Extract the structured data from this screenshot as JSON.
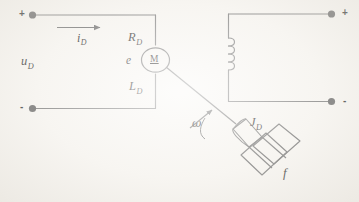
{
  "figure": {
    "background_color": "#f7f5f1",
    "line_color": "#6e6e6e",
    "text_color": "#1a1a1a"
  },
  "armature_circuit": {
    "name": "armature-circuit",
    "supply_voltage_label": "u",
    "supply_voltage_sub": "D",
    "current_label": "i",
    "current_sub": "D",
    "resistance_label": "R",
    "resistance_sub": "D",
    "inductance_label": "L",
    "inductance_sub": "D",
    "back_emf_label": "e",
    "motor_symbol_label": "M",
    "terminal_positive": "+",
    "terminal_negative": "-"
  },
  "field_circuit": {
    "name": "field-winding-circuit",
    "terminal_positive": "+",
    "terminal_negative": "-",
    "coil_turns": 4
  },
  "mechanical_load": {
    "name": "mechanical-load",
    "angular_speed_label": "ω",
    "inertia_label": "J",
    "inertia_sub": "D",
    "friction_label": "f"
  }
}
